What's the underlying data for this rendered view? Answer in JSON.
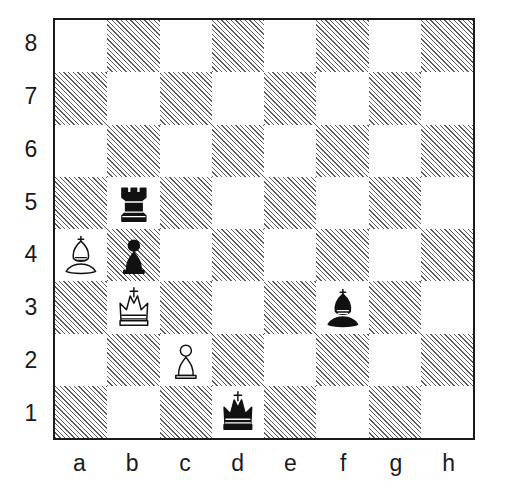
{
  "diagram": {
    "kind": "chess-board-diagram",
    "orientation": "white-bottom",
    "board_size": 8,
    "colors": {
      "light_square": "#ffffff",
      "dark_square_hatch": "#5d5d5d",
      "border": "#1a1a1a",
      "label_text": "#1a1a1a",
      "page_background": "#ffffff",
      "white_piece_fill": "#ffffff",
      "black_piece_fill": "#111111"
    },
    "rank_labels": [
      "8",
      "7",
      "6",
      "5",
      "4",
      "3",
      "2",
      "1"
    ],
    "file_labels": [
      "a",
      "b",
      "c",
      "d",
      "e",
      "f",
      "g",
      "h"
    ],
    "squares": [
      {
        "id": "a8",
        "shade": "light",
        "piece": null
      },
      {
        "id": "b8",
        "shade": "dark",
        "piece": null
      },
      {
        "id": "c8",
        "shade": "light",
        "piece": null
      },
      {
        "id": "d8",
        "shade": "dark",
        "piece": null
      },
      {
        "id": "e8",
        "shade": "light",
        "piece": null
      },
      {
        "id": "f8",
        "shade": "dark",
        "piece": null
      },
      {
        "id": "g8",
        "shade": "light",
        "piece": null
      },
      {
        "id": "h8",
        "shade": "dark",
        "piece": null
      },
      {
        "id": "a7",
        "shade": "dark",
        "piece": null
      },
      {
        "id": "b7",
        "shade": "light",
        "piece": null
      },
      {
        "id": "c7",
        "shade": "dark",
        "piece": null
      },
      {
        "id": "d7",
        "shade": "light",
        "piece": null
      },
      {
        "id": "e7",
        "shade": "dark",
        "piece": null
      },
      {
        "id": "f7",
        "shade": "light",
        "piece": null
      },
      {
        "id": "g7",
        "shade": "dark",
        "piece": null
      },
      {
        "id": "h7",
        "shade": "light",
        "piece": null
      },
      {
        "id": "a6",
        "shade": "light",
        "piece": null
      },
      {
        "id": "b6",
        "shade": "dark",
        "piece": null
      },
      {
        "id": "c6",
        "shade": "light",
        "piece": null
      },
      {
        "id": "d6",
        "shade": "dark",
        "piece": null
      },
      {
        "id": "e6",
        "shade": "light",
        "piece": null
      },
      {
        "id": "f6",
        "shade": "dark",
        "piece": null
      },
      {
        "id": "g6",
        "shade": "light",
        "piece": null
      },
      {
        "id": "h6",
        "shade": "dark",
        "piece": null
      },
      {
        "id": "a5",
        "shade": "dark",
        "piece": null
      },
      {
        "id": "b5",
        "shade": "light",
        "piece": "black-rook"
      },
      {
        "id": "c5",
        "shade": "dark",
        "piece": null
      },
      {
        "id": "d5",
        "shade": "light",
        "piece": null
      },
      {
        "id": "e5",
        "shade": "dark",
        "piece": null
      },
      {
        "id": "f5",
        "shade": "light",
        "piece": null
      },
      {
        "id": "g5",
        "shade": "dark",
        "piece": null
      },
      {
        "id": "h5",
        "shade": "light",
        "piece": null
      },
      {
        "id": "a4",
        "shade": "light",
        "piece": "white-bishop"
      },
      {
        "id": "b4",
        "shade": "dark",
        "piece": "black-pawn"
      },
      {
        "id": "c4",
        "shade": "light",
        "piece": null
      },
      {
        "id": "d4",
        "shade": "dark",
        "piece": null
      },
      {
        "id": "e4",
        "shade": "light",
        "piece": null
      },
      {
        "id": "f4",
        "shade": "dark",
        "piece": null
      },
      {
        "id": "g4",
        "shade": "light",
        "piece": null
      },
      {
        "id": "h4",
        "shade": "dark",
        "piece": null
      },
      {
        "id": "a3",
        "shade": "dark",
        "piece": null
      },
      {
        "id": "b3",
        "shade": "light",
        "piece": "white-king"
      },
      {
        "id": "c3",
        "shade": "dark",
        "piece": null
      },
      {
        "id": "d3",
        "shade": "light",
        "piece": null
      },
      {
        "id": "e3",
        "shade": "dark",
        "piece": null
      },
      {
        "id": "f3",
        "shade": "light",
        "piece": "black-bishop"
      },
      {
        "id": "g3",
        "shade": "dark",
        "piece": null
      },
      {
        "id": "h3",
        "shade": "light",
        "piece": null
      },
      {
        "id": "a2",
        "shade": "light",
        "piece": null
      },
      {
        "id": "b2",
        "shade": "dark",
        "piece": null
      },
      {
        "id": "c2",
        "shade": "light",
        "piece": "white-pawn"
      },
      {
        "id": "d2",
        "shade": "dark",
        "piece": null
      },
      {
        "id": "e2",
        "shade": "light",
        "piece": null
      },
      {
        "id": "f2",
        "shade": "dark",
        "piece": null
      },
      {
        "id": "g2",
        "shade": "light",
        "piece": null
      },
      {
        "id": "h2",
        "shade": "dark",
        "piece": null
      },
      {
        "id": "a1",
        "shade": "dark",
        "piece": null
      },
      {
        "id": "b1",
        "shade": "light",
        "piece": null
      },
      {
        "id": "c1",
        "shade": "dark",
        "piece": null
      },
      {
        "id": "d1",
        "shade": "light",
        "piece": "black-king"
      },
      {
        "id": "e1",
        "shade": "dark",
        "piece": null
      },
      {
        "id": "f1",
        "shade": "light",
        "piece": null
      },
      {
        "id": "g1",
        "shade": "dark",
        "piece": null
      },
      {
        "id": "h1",
        "shade": "light",
        "piece": null
      }
    ],
    "pieces": [
      {
        "square": "b5",
        "color": "black",
        "type": "rook",
        "glyph": "♜"
      },
      {
        "square": "a4",
        "color": "white",
        "type": "bishop",
        "glyph": "♗"
      },
      {
        "square": "b4",
        "color": "black",
        "type": "pawn",
        "glyph": "♟"
      },
      {
        "square": "b3",
        "color": "white",
        "type": "king",
        "glyph": "♔"
      },
      {
        "square": "f3",
        "color": "black",
        "type": "bishop",
        "glyph": "♝"
      },
      {
        "square": "c2",
        "color": "white",
        "type": "pawn",
        "glyph": "♙"
      },
      {
        "square": "d1",
        "color": "black",
        "type": "king",
        "glyph": "♚"
      }
    ]
  }
}
